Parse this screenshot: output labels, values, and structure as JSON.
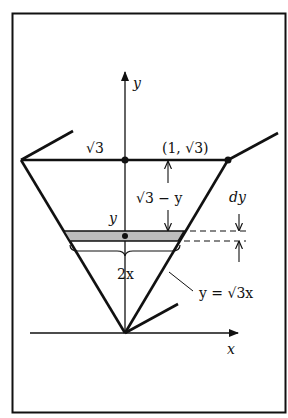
{
  "diagram": {
    "axes": {
      "x_label": "x",
      "y_label": "y"
    },
    "labels": {
      "sqrt3_left": "√3",
      "point": "(1, √3)",
      "height_remaining": "√3 − y",
      "strip_height": "dy",
      "strip_level": "y",
      "width": "2x",
      "line_equation": "y = √3x"
    },
    "colors": {
      "stroke": "#111111",
      "strip_fill": "#bdbdbd",
      "background": "#ffffff"
    }
  }
}
